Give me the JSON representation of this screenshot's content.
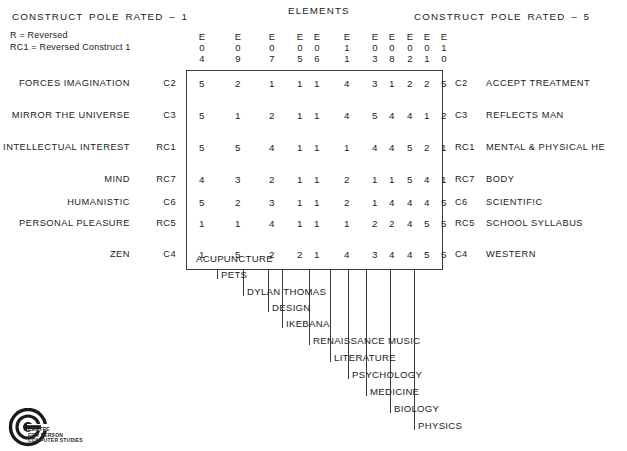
{
  "headers": {
    "left_pole": "CONSTRUCT  POLE  RATED  –  1",
    "right_pole": "CONSTRUCT  POLE  RATED  –  5",
    "elements_title": "ELEMENTS"
  },
  "legend": {
    "line1": "R = Reversed",
    "line2": "RC1 = Reversed Construct 1"
  },
  "grid": {
    "column_headers": [
      {
        "l1": "E",
        "l2": "0",
        "l3": "4"
      },
      {
        "l1": "E",
        "l2": "0",
        "l3": "9"
      },
      {
        "l1": "E",
        "l2": "0",
        "l3": "7"
      },
      {
        "l1": "E",
        "l2": "0",
        "l3": "5"
      },
      {
        "l1": "E",
        "l2": "0",
        "l3": "6"
      },
      {
        "l1": "E",
        "l2": "1",
        "l3": "1"
      },
      {
        "l1": "E",
        "l2": "0",
        "l3": "3"
      },
      {
        "l1": "E",
        "l2": "0",
        "l3": "8"
      },
      {
        "l1": "E",
        "l2": "0",
        "l3": "2"
      },
      {
        "l1": "E",
        "l2": "0",
        "l3": "1"
      },
      {
        "l1": "E",
        "l2": "1",
        "l3": "0"
      }
    ],
    "element_labels": [
      "ACUPUNCTURE",
      "PETS",
      "DYLAN THOMAS",
      "DESIGN",
      "IKEBANA",
      "RENAISSANCE MUSIC",
      "LITERATURE",
      "PSYCHOLOGY",
      "MEDICINE",
      "BIOLOGY",
      "PHYSICS"
    ],
    "rows": [
      {
        "left_label": "FORCES IMAGINATION",
        "left_code": "C2",
        "right_code": "C2",
        "right_label": "ACCEPT TREATMENT",
        "values": [
          5,
          2,
          1,
          1,
          1,
          4,
          3,
          1,
          2,
          2,
          5
        ]
      },
      {
        "left_label": "MIRROR THE UNIVERSE",
        "left_code": "C3",
        "right_code": "C3",
        "right_label": "REFLECTS MAN",
        "values": [
          5,
          1,
          2,
          1,
          1,
          4,
          5,
          4,
          4,
          1,
          2
        ]
      },
      {
        "left_label": "INTELLECTUAL INTEREST",
        "left_code": "RC1",
        "right_code": "RC1",
        "right_label": "MENTAL & PHYSICAL HE",
        "values": [
          5,
          5,
          4,
          1,
          1,
          1,
          4,
          4,
          5,
          2,
          1
        ]
      },
      {
        "left_label": "MIND",
        "left_code": "RC7",
        "right_code": "RC7",
        "right_label": "BODY",
        "values": [
          4,
          3,
          2,
          1,
          1,
          2,
          1,
          1,
          5,
          4,
          1
        ]
      },
      {
        "left_label": "HUMANISTIC",
        "left_code": "C6",
        "right_code": "C6",
        "right_label": "SCIENTIF!C",
        "values": [
          5,
          2,
          3,
          1,
          1,
          2,
          1,
          4,
          4,
          4,
          5
        ]
      },
      {
        "left_label": "PERSONAL PLEASURE",
        "left_code": "RC5",
        "right_code": "RC5",
        "right_label": "SCHOOL SYLLABUS",
        "values": [
          1,
          1,
          4,
          1,
          1,
          1,
          2,
          2,
          4,
          5,
          5
        ]
      },
      {
        "left_label": "ZEN",
        "left_code": "C4",
        "right_code": "C4",
        "right_label": "WESTERN",
        "values": [
          1,
          5,
          2,
          2,
          1,
          4,
          3,
          4,
          4,
          5,
          5
        ]
      }
    ]
  },
  "logo": {
    "line1": "CENTRE",
    "line2": "FOR PERSON",
    "line3": "COMPUTER STUDIES"
  },
  "colors": {
    "ink": "#222222",
    "rule": "#3a3a3a",
    "background": "#ffffff"
  }
}
